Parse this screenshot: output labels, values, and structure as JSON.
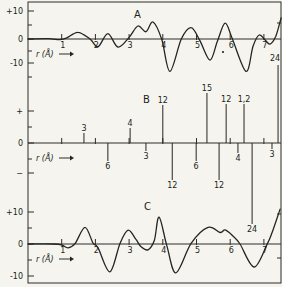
{
  "figure": {
    "width": 282,
    "height": 287,
    "background": "#f6f4ef",
    "ink": "#26241f"
  },
  "chart_data": {
    "type": "multi-panel",
    "xlabel": "r (Å)",
    "x_tick_labels": [
      "1",
      "2",
      "3",
      "4",
      "5",
      "6",
      "7"
    ],
    "x_mapping": {
      "x0_px": 28,
      "px_per_angstrom": 33.7
    },
    "frame": {
      "left_x": 28,
      "top_y": 2,
      "right_x": 281,
      "bottom_y": 283
    },
    "right_border_ticks_y": [
      23,
      214,
      258
    ],
    "artifact_dot": {
      "x": 223,
      "y": 52
    },
    "panels": [
      {
        "title": "A",
        "type": "line",
        "zero_y_px": 39,
        "px_per_unit": 2.7,
        "ylim": [
          -13,
          13
        ],
        "show_x_labels": true,
        "letter_pos": [
          134,
          18
        ],
        "xlabel_y": 57,
        "yticks": [
          {
            "label": "+10",
            "y_px": 11
          },
          {
            "label": "0",
            "y_px": 39
          },
          {
            "label": "-10",
            "y_px": 63
          }
        ],
        "minor_ytick_y_px": [
          25,
          51,
          77
        ],
        "points": [
          [
            0,
            0
          ],
          [
            0.6,
            0.1
          ],
          [
            0.95,
            -0.25
          ],
          [
            1.15,
            0.4
          ],
          [
            1.48,
            2.5
          ],
          [
            1.84,
            0
          ],
          [
            2.08,
            -2.8
          ],
          [
            2.37,
            2.0
          ],
          [
            2.67,
            -3.0
          ],
          [
            3.0,
            0.6
          ],
          [
            3.26,
            4.8
          ],
          [
            3.5,
            2.7
          ],
          [
            3.71,
            6.3
          ],
          [
            3.97,
            -0.2
          ],
          [
            4.21,
            -12.0
          ],
          [
            4.55,
            0
          ],
          [
            4.84,
            4.2
          ],
          [
            5.1,
            -0.6
          ],
          [
            5.4,
            -7.8
          ],
          [
            5.62,
            -0.8
          ],
          [
            5.85,
            5.9
          ],
          [
            6.06,
            0.2
          ],
          [
            6.47,
            -12.0
          ],
          [
            6.68,
            -2.6
          ],
          [
            6.86,
            1.5
          ],
          [
            7.03,
            -0.3
          ],
          [
            7.18,
            -1.9
          ],
          [
            7.35,
            0.9
          ],
          [
            7.51,
            7.8
          ]
        ]
      },
      {
        "title": "B",
        "type": "bar",
        "zero_y_px": 143,
        "px_per_unit": 3.3,
        "show_x_labels": false,
        "letter_pos": [
          143,
          103
        ],
        "xlabel_y": 161,
        "yticks": [
          {
            "label": "+",
            "y_px": 111
          },
          {
            "label": "0",
            "y_px": 143
          },
          {
            "label": "−",
            "y_px": 173
          }
        ],
        "minor_ytick_y_px": [
          127,
          159
        ],
        "spikes": [
          {
            "r": 1.66,
            "label": "3",
            "sign": 1,
            "h": 10
          },
          {
            "r": 2.37,
            "label": "6",
            "sign": -1,
            "h": 18
          },
          {
            "r": 3.03,
            "label": "4",
            "sign": 1,
            "h": 15
          },
          {
            "r": 3.5,
            "label": "3",
            "sign": -1,
            "h": 8
          },
          {
            "r": 4.0,
            "label": "12",
            "sign": 1,
            "h": 38
          },
          {
            "r": 4.28,
            "label": "12",
            "sign": -1,
            "h": 37
          },
          {
            "r": 4.99,
            "label": "6",
            "sign": -1,
            "h": 18
          },
          {
            "r": 5.31,
            "label": "15",
            "sign": 1,
            "h": 50
          },
          {
            "r": 5.67,
            "label": "12",
            "sign": -1,
            "h": 37
          },
          {
            "r": 5.88,
            "label": "12",
            "sign": 1,
            "h": 39
          },
          {
            "r": 6.23,
            "label": "4",
            "sign": -1,
            "h": 10
          },
          {
            "r": 6.41,
            "label": "1,2",
            "sign": 1,
            "h": 39
          },
          {
            "r": 6.65,
            "label": "24",
            "sign": -1,
            "h": 81
          },
          {
            "r": 7.24,
            "label": "3",
            "sign": -1,
            "h": 6
          },
          {
            "r": 7.42,
            "label": "24",
            "sign": 1,
            "h": 78,
            "dx": -3,
            "dy": -2
          }
        ]
      },
      {
        "title": "C",
        "type": "line",
        "zero_y_px": 244,
        "px_per_unit": 3.2,
        "ylim": [
          -11,
          12
        ],
        "show_x_labels": true,
        "letter_pos": [
          144,
          210
        ],
        "xlabel_y": 262,
        "yticks": [
          {
            "label": "+10",
            "y_px": 212
          },
          {
            "label": "0",
            "y_px": 244
          },
          {
            "label": "-10",
            "y_px": 276
          }
        ],
        "minor_ytick_y_px": [
          228,
          260
        ],
        "points": [
          [
            0,
            0
          ],
          [
            0.75,
            0
          ],
          [
            1.0,
            -0.3
          ],
          [
            1.19,
            -1.2
          ],
          [
            1.4,
            0.2
          ],
          [
            1.69,
            5.2
          ],
          [
            1.93,
            0.3
          ],
          [
            2.08,
            -1.2
          ],
          [
            2.43,
            -8.7
          ],
          [
            2.73,
            0.2
          ],
          [
            2.97,
            4.3
          ],
          [
            3.2,
            1.5
          ],
          [
            3.35,
            -0.8
          ],
          [
            3.56,
            -1.8
          ],
          [
            3.75,
            1.2
          ],
          [
            3.89,
            8.4
          ],
          [
            4.12,
            -0.5
          ],
          [
            4.39,
            -9.0
          ],
          [
            4.84,
            0.2
          ],
          [
            5.34,
            5.2
          ],
          [
            5.7,
            3.6
          ],
          [
            5.85,
            4.4
          ],
          [
            6.08,
            2.5
          ],
          [
            6.29,
            0
          ],
          [
            6.71,
            -7.2
          ],
          [
            7.09,
            -0.2
          ],
          [
            7.24,
            3.5
          ],
          [
            7.48,
            10.9
          ]
        ]
      }
    ]
  }
}
